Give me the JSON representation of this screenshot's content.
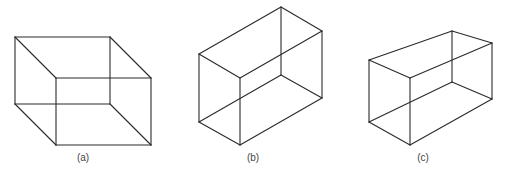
{
  "figure": {
    "stroke_color": "#2a2a2a",
    "background": "#ffffff",
    "panels": [
      {
        "id": "a",
        "label": "(a)",
        "label_x": 83,
        "description": "Necker-cube style wireframe box, oblique projection",
        "edges": [
          [
            15,
            37,
            110,
            37
          ],
          [
            15,
            37,
            15,
            104
          ],
          [
            110,
            37,
            110,
            104
          ],
          [
            15,
            104,
            110,
            104
          ],
          [
            56,
            78,
            151,
            78
          ],
          [
            56,
            78,
            56,
            145
          ],
          [
            151,
            78,
            151,
            145
          ],
          [
            56,
            145,
            151,
            145
          ],
          [
            15,
            37,
            56,
            78
          ],
          [
            110,
            37,
            151,
            78
          ],
          [
            15,
            104,
            56,
            145
          ],
          [
            110,
            104,
            151,
            145
          ]
        ]
      },
      {
        "id": "b",
        "label": "(b)",
        "label_x": 253,
        "description": "Wireframe rectangular box, isometric-like projection",
        "edges": [
          [
            199,
            54,
            281,
            7
          ],
          [
            281,
            7,
            322,
            31
          ],
          [
            322,
            31,
            240,
            78
          ],
          [
            240,
            78,
            199,
            54
          ],
          [
            199,
            54,
            199,
            122
          ],
          [
            240,
            78,
            240,
            145
          ],
          [
            322,
            31,
            322,
            98
          ],
          [
            281,
            7,
            281,
            75
          ],
          [
            199,
            122,
            240,
            145
          ],
          [
            240,
            145,
            322,
            98
          ],
          [
            199,
            122,
            281,
            75
          ],
          [
            281,
            75,
            322,
            98
          ]
        ]
      },
      {
        "id": "c",
        "label": "(c)",
        "label_x": 423,
        "description": "Wireframe rectangular box, perspective-distorted projection",
        "edges": [
          [
            369,
            60,
            452,
            31
          ],
          [
            452,
            31,
            492,
            43
          ],
          [
            492,
            43,
            410,
            78
          ],
          [
            410,
            78,
            369,
            60
          ],
          [
            369,
            60,
            369,
            122
          ],
          [
            410,
            78,
            410,
            145
          ],
          [
            492,
            43,
            492,
            99
          ],
          [
            452,
            31,
            452,
            82
          ],
          [
            369,
            122,
            410,
            145
          ],
          [
            410,
            145,
            492,
            99
          ],
          [
            369,
            122,
            452,
            82
          ],
          [
            452,
            82,
            492,
            99
          ]
        ]
      }
    ]
  }
}
